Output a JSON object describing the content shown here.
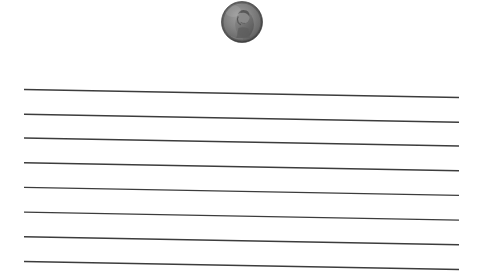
{
  "scene": {
    "title": "Penny above ruled lines",
    "background_color": "#ffffff",
    "width": 480,
    "height": 273
  },
  "coin": {
    "name": "US one cent Lincoln penny",
    "denomination": "1 cent",
    "obverse_subject": "Abraham Lincoln portrait facing right",
    "finish": "worn grayscale metal",
    "center_x": 242,
    "center_y": 22,
    "diameter": 41,
    "rim_color": "#5c5c5c",
    "face_color": "#7b7b7b",
    "shadow_color": "#4a4a4a",
    "highlight_color": "#9d9d9d"
  },
  "ruled_lines": {
    "count": 8,
    "color": "#3c3c3c",
    "thickness": 1.45,
    "x_start": 24,
    "x_end": 459,
    "spacing": 24.7,
    "slant_drop": 8,
    "lines": [
      {
        "label": "line-1",
        "y_left": 89.5,
        "y_right": 97.5
      },
      {
        "label": "line-2",
        "y_left": 114.2,
        "y_right": 122.2
      },
      {
        "label": "line-3",
        "y_left": 138.0,
        "y_right": 146.0
      },
      {
        "label": "line-4",
        "y_left": 162.7,
        "y_right": 170.7
      },
      {
        "label": "line-5",
        "y_left": 187.4,
        "y_right": 195.4
      },
      {
        "label": "line-6",
        "y_left": 212.1,
        "y_right": 220.1
      },
      {
        "label": "line-7",
        "y_left": 236.8,
        "y_right": 244.8
      },
      {
        "label": "line-8",
        "y_left": 261.5,
        "y_right": 269.5
      }
    ]
  }
}
